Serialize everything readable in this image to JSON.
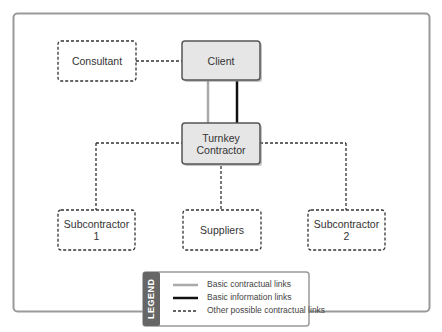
{
  "diagram": {
    "nodes": [
      {
        "id": "consultant",
        "label": "Consultant",
        "style": "dashed"
      },
      {
        "id": "client",
        "label": "Client",
        "style": "solid"
      },
      {
        "id": "turnkey",
        "label": "Turnkey\nContractor",
        "line1": "Turnkey",
        "line2": "Contractor",
        "style": "solid"
      },
      {
        "id": "sub1",
        "line1": "Subcontractor",
        "line2": "1",
        "style": "dashed"
      },
      {
        "id": "suppliers",
        "label": "Suppliers",
        "style": "dashed"
      },
      {
        "id": "sub2",
        "line1": "Subcontractor",
        "line2": "2",
        "style": "dashed"
      }
    ],
    "edges": [
      {
        "from": "consultant",
        "to": "client",
        "type": "other-contractual"
      },
      {
        "from": "client",
        "to": "turnkey",
        "type": "basic-contractual"
      },
      {
        "from": "client",
        "to": "turnkey",
        "type": "basic-information"
      },
      {
        "from": "turnkey",
        "to": "sub1",
        "type": "other-contractual"
      },
      {
        "from": "turnkey",
        "to": "suppliers",
        "type": "other-contractual"
      },
      {
        "from": "turnkey",
        "to": "sub2",
        "type": "other-contractual"
      }
    ]
  },
  "legend": {
    "title": "LEGEND",
    "items": [
      {
        "label": "Basic contractual links",
        "line": "solid-gray",
        "color": "#aaaaaa"
      },
      {
        "label": "Basic information links",
        "line": "solid-black",
        "color": "#111111"
      },
      {
        "label": "Other possible contractual links",
        "line": "dashed",
        "color": "#333333"
      }
    ]
  },
  "colors": {
    "frame_border": "#9a9a9a",
    "solid_box_fill": "#e6e6e6",
    "solid_box_border": "#555555",
    "legend_tab": "#666666"
  }
}
